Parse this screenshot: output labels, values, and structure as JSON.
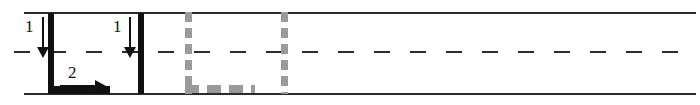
{
  "figure": {
    "width": 700,
    "height": 105,
    "background": "#ffffff"
  },
  "colors": {
    "wall": "#2b2b2b",
    "centerline": "#2b2b2b",
    "obstacle_solid": "#111111",
    "obstacle_ghost": "#9a9a9a",
    "annotation": "#111111"
  },
  "channel": {
    "top_wall_name": "top-wall",
    "bottom_wall_name": "bottom-wall",
    "centerline_name": "centerline",
    "centerline_style": "dashed"
  },
  "obstacle_solid": {
    "name": "solid-plate-assembly",
    "style": "solid",
    "left_plate_name": "left-vertical-plate",
    "right_plate_name": "right-vertical-plate",
    "base_name": "horizontal-base-bar"
  },
  "obstacle_ghost": {
    "name": "ghost-plate-assembly",
    "style": "dashed",
    "left_plate_name": "ghost-left-vertical-plate",
    "right_plate_name": "ghost-right-vertical-plate",
    "base_name": "ghost-horizontal-base-bar"
  },
  "annotations": [
    {
      "label": "1",
      "direction": "down",
      "icon": "down-arrow-icon",
      "target": "left-vertical-plate"
    },
    {
      "label": "1",
      "direction": "down",
      "icon": "down-arrow-icon",
      "target": "right-vertical-plate"
    },
    {
      "label": "2",
      "direction": "right",
      "icon": "right-arrow-icon",
      "target": "horizontal-base-bar"
    }
  ]
}
